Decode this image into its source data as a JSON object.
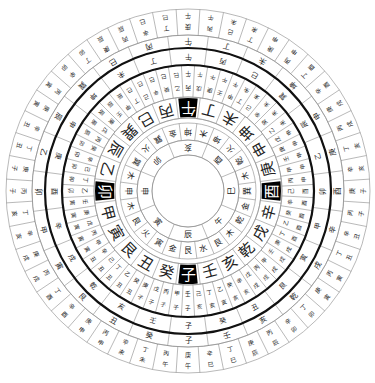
{
  "diagram": {
    "title": "",
    "type": "luopan-compass",
    "center": [
      188,
      191
    ],
    "colors": {
      "line": "#8a8a8a",
      "thick_line": "#111111",
      "highlight_bg": "#000000",
      "highlight_text": "#ffffff",
      "text": "#222222"
    },
    "rings": {
      "innermost_circle_radius": 36,
      "inner_branches": {
        "r_in": 36,
        "r_out": 51,
        "rotation_offset": 0,
        "labels": [
          "亥",
          "酉",
          "巳",
          "午",
          "辰",
          "寅",
          "申",
          "卯"
        ]
      },
      "trigrams_elements": {
        "r_in": 51,
        "r_out": 68,
        "rotation_offset": 0,
        "labels": [
          "坤",
          "木",
          "坤",
          "火",
          "乾",
          "木",
          "巽",
          "金",
          "乾",
          "木",
          "艮",
          "水",
          "艮",
          "金",
          "寅",
          "火",
          "艮",
          "木",
          "申",
          "木",
          "巽",
          "火",
          "巽",
          "金"
        ]
      },
      "twenty_four_mountains": {
        "r_in": 73,
        "r_out": 94,
        "labels": [
          "午",
          "丁",
          "未",
          "坤",
          "申",
          "庚",
          "酉",
          "辛",
          "戌",
          "乾",
          "亥",
          "壬",
          "子",
          "癸",
          "丑",
          "艮",
          "寅",
          "甲",
          "卯",
          "乙",
          "辰",
          "巽",
          "巳",
          "丙"
        ],
        "highlighted": [
          "午",
          "酉",
          "子",
          "卯"
        ]
      },
      "sixty_dragons_inner": {
        "r_in": 94,
        "r_out": 126,
        "labels": [
          "丙午",
          "戊午",
          "庚午",
          "壬午",
          "甲午",
          "丁未",
          "己未",
          "辛未",
          "癸未",
          "乙未",
          "戊申",
          "庚申",
          "壬申",
          "甲申",
          "丙申",
          "己酉",
          "辛酉",
          "癸酉",
          "乙酉",
          "丁酉",
          "庚戌",
          "壬戌",
          "甲戌",
          "丙戌",
          "戊戌",
          "辛亥",
          "癸亥",
          "乙亥",
          "丁亥",
          "己亥",
          "壬子",
          "甲子",
          "丙子",
          "戊子",
          "庚子",
          "癸丑",
          "乙丑",
          "丁丑",
          "己丑",
          "辛丑",
          "甲寅",
          "丙寅",
          "戊寅",
          "庚寅",
          "壬寅",
          "乙卯",
          "丁卯",
          "己卯",
          "辛卯",
          "癸卯",
          "丙辰",
          "戊辰",
          "庚辰",
          "壬辰",
          "甲辰",
          "丁巳",
          "己巳",
          "辛巳",
          "癸巳",
          "乙巳"
        ]
      },
      "sixty_dragons_outer": {
        "r_in": 126,
        "r_out": 143,
        "labels": [
          "午",
          "丙",
          "巳",
          "巽",
          "辰",
          "乙",
          "卯",
          "甲",
          "寅",
          "艮",
          "丑",
          "癸",
          "子",
          "壬",
          "亥",
          "乾",
          "戌",
          "辛",
          "酉",
          "庚",
          "申",
          "坤",
          "未",
          "丁"
        ]
      },
      "mountains_outer": {
        "r_in": 143,
        "r_out": 156,
        "labels": [
          "午",
          "丁",
          "未",
          "坤",
          "申",
          "庚",
          "酉",
          "辛",
          "戌",
          "乾",
          "亥",
          "壬",
          "子",
          "癸",
          "丑",
          "艮",
          "寅",
          "甲",
          "卯",
          "乙",
          "辰",
          "巽",
          "巳",
          "丙"
        ]
      },
      "outer_pairs": {
        "r_in": 156,
        "r_out": 182,
        "labels": [
          "庚午",
          "丙午",
          "己未",
          "丁未",
          "庚申",
          "丙申",
          "丁酉",
          "辛酉",
          "庚戌",
          "丙戌",
          "丁亥",
          "辛亥",
          "庚子",
          "丙子",
          "辛丑",
          "丁丑",
          "丙寅",
          "庚寅",
          "丁卯",
          "辛卯",
          "丙辰",
          "庚辰",
          "丁巳",
          "辛巳",
          "庚午",
          "丙午",
          "丁未",
          "辛未",
          "丙申",
          "庚申",
          "辛酉",
          "丁酉",
          "丙戌",
          "庚戌",
          "辛亥",
          "丁亥",
          "丙子",
          "庚子",
          "丁丑",
          "辛丑",
          "庚寅",
          "丙寅",
          "辛卯",
          "丁卯",
          "庚辰",
          "丙辰",
          "辛巳",
          "丁巳"
        ]
      }
    },
    "thick_circles": [
      126,
      143
    ]
  }
}
